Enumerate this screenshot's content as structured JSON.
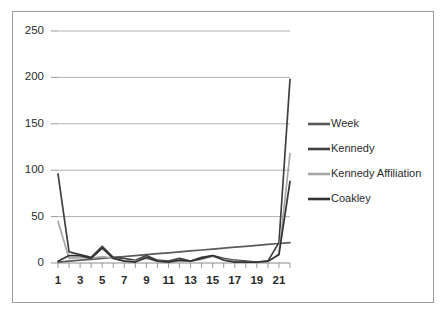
{
  "chart_data": {
    "type": "line",
    "title": "",
    "xlabel": "",
    "ylabel": "",
    "x": [
      1,
      2,
      3,
      4,
      5,
      6,
      7,
      8,
      9,
      10,
      11,
      12,
      13,
      14,
      15,
      16,
      17,
      18,
      19,
      20,
      21,
      22
    ],
    "xlim": [
      1,
      22
    ],
    "ylim": [
      0,
      250
    ],
    "yticks": [
      0,
      50,
      100,
      150,
      200,
      250
    ],
    "xticks": [
      1,
      2,
      3,
      4,
      5,
      6,
      7,
      8,
      9,
      10,
      11,
      12,
      13,
      14,
      15,
      16,
      17,
      18,
      19,
      20,
      21,
      22
    ],
    "xtick_labels_shown": [
      "1",
      "3",
      "5",
      "7",
      "9",
      "11",
      "13",
      "15",
      "17",
      "19",
      "21"
    ],
    "grid": "horizontal",
    "legend_position": "right",
    "series": [
      {
        "name": "Week",
        "color": "#595959",
        "values": [
          1,
          2,
          3,
          4,
          5,
          6,
          7,
          8,
          9,
          10,
          11,
          12,
          13,
          14,
          15,
          16,
          17,
          18,
          19,
          20,
          21,
          22
        ]
      },
      {
        "name": "Kennedy",
        "color": "#404040",
        "values": [
          96,
          12,
          9,
          6,
          18,
          6,
          5,
          3,
          8,
          3,
          2,
          5,
          2,
          6,
          8,
          5,
          3,
          2,
          1,
          2,
          22,
          198
        ]
      },
      {
        "name": "Kennedy Affiliation",
        "color": "#a6a6a6",
        "values": [
          45,
          5,
          6,
          5,
          7,
          5,
          2,
          2,
          5,
          2,
          1,
          2,
          2,
          4,
          7,
          4,
          2,
          1,
          1,
          1,
          10,
          118
        ]
      },
      {
        "name": "Coakley",
        "color": "#333333",
        "values": [
          2,
          8,
          8,
          5,
          16,
          5,
          2,
          1,
          6,
          2,
          1,
          3,
          2,
          5,
          8,
          3,
          1,
          1,
          1,
          2,
          9,
          88
        ]
      }
    ]
  },
  "y_axis": {
    "ticks": [
      "0",
      "50",
      "100",
      "150",
      "200",
      "250"
    ]
  },
  "x_axis": {
    "ticks": [
      "1",
      "3",
      "5",
      "7",
      "9",
      "11",
      "13",
      "15",
      "17",
      "19",
      "21"
    ]
  },
  "legend": {
    "items": [
      {
        "label": "Week",
        "color": "#595959"
      },
      {
        "label": "Kennedy",
        "color": "#404040"
      },
      {
        "label": "Kennedy Affiliation",
        "color": "#a6a6a6"
      },
      {
        "label": "Coakley",
        "color": "#333333"
      }
    ]
  },
  "colors": {
    "frame_border": "#9b9b9b",
    "gridline": "#a8a8a8",
    "axis_line": "#8c8c8c",
    "text": "#2b2b2b",
    "background": "#ffffff"
  }
}
